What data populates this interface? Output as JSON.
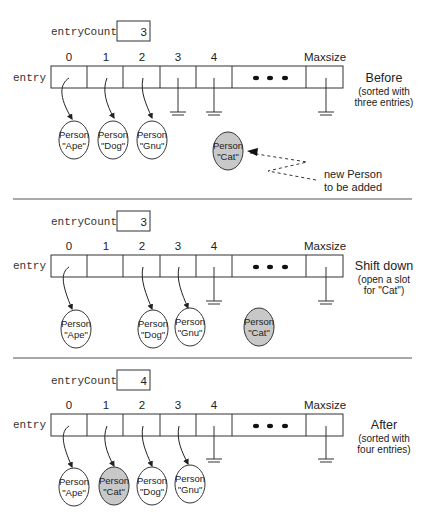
{
  "sections": [
    {
      "id": "before",
      "entry_count_label": "entryCount",
      "entry_count_value": "3",
      "array_label": "entry",
      "indices": [
        "0",
        "1",
        "2",
        "3",
        "4"
      ],
      "ellipsis": "• • •",
      "max_label": "Maxsize",
      "caption_title": "Before",
      "caption_line1": "(sorted with",
      "caption_line2": "three entries)",
      "persons": [
        {
          "line1": "Person",
          "line2": "\"Ape\"",
          "highlighted": false
        },
        {
          "line1": "Person",
          "line2": "\"Dog\"",
          "highlighted": false
        },
        {
          "line1": "Person",
          "line2": "\"Gnu\"",
          "highlighted": false
        }
      ],
      "new_person": {
        "line1": "Person",
        "line2": "\"Cat\""
      },
      "annotation_line1": "new Person",
      "annotation_line2": "to be added"
    },
    {
      "id": "shift",
      "entry_count_label": "entryCount",
      "entry_count_value": "3",
      "array_label": "entry",
      "indices": [
        "0",
        "1",
        "2",
        "3",
        "4"
      ],
      "ellipsis": "• • •",
      "max_label": "Maxsize",
      "caption_title": "Shift down",
      "caption_line1": "(open a slot",
      "caption_line2": "for \"Cat\")",
      "persons": [
        {
          "line1": "Person",
          "line2": "\"Ape\"",
          "highlighted": false
        },
        {
          "line1": "Person",
          "line2": "\"Dog\"",
          "highlighted": false
        },
        {
          "line1": "Person",
          "line2": "\"Gnu\"",
          "highlighted": false
        },
        {
          "line1": "Person",
          "line2": "\"Cat\"",
          "highlighted": true
        }
      ]
    },
    {
      "id": "after",
      "entry_count_label": "entryCount",
      "entry_count_value": "4",
      "array_label": "entry",
      "indices": [
        "0",
        "1",
        "2",
        "3",
        "4"
      ],
      "ellipsis": "• • •",
      "max_label": "Maxsize",
      "caption_title": "After",
      "caption_line1": "(sorted with",
      "caption_line2": "four entries)",
      "persons": [
        {
          "line1": "Person",
          "line2": "\"Ape\"",
          "highlighted": false
        },
        {
          "line1": "Person",
          "line2": "\"Cat\"",
          "highlighted": true
        },
        {
          "line1": "Person",
          "line2": "\"Dog\"",
          "highlighted": false
        },
        {
          "line1": "Person",
          "line2": "\"Gnu\"",
          "highlighted": false
        }
      ]
    }
  ],
  "colors": {
    "stroke": "#333333",
    "highlight_fill": "#c8c8c8",
    "node_fill": "#ffffff"
  }
}
